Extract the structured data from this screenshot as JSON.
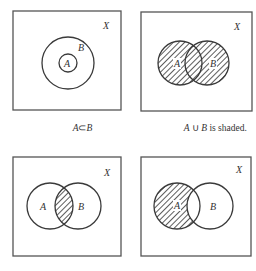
{
  "figure": {
    "colors": {
      "stroke": "#3a3a3a",
      "frame": "#555555",
      "hatch": "#333333",
      "background": "#ffffff"
    },
    "panels": [
      {
        "id": "subset",
        "universe_label": "X",
        "set_labels": {
          "A": "A",
          "B": "B"
        },
        "relationship": "A inside B",
        "shaded_region": "none",
        "caption_parts": [
          {
            "text": "A",
            "italic": true
          },
          {
            "text": "⊂",
            "italic": false
          },
          {
            "text": "B",
            "italic": true
          }
        ]
      },
      {
        "id": "union",
        "universe_label": "X",
        "set_labels": {
          "A": "A",
          "B": "B"
        },
        "relationship": "overlapping",
        "shaded_region": "A ∪ B",
        "caption_parts": [
          {
            "text": "A",
            "italic": true
          },
          {
            "text": " ∪ ",
            "italic": false
          },
          {
            "text": "B",
            "italic": true
          },
          {
            "text": " is shaded.",
            "italic": false
          }
        ]
      },
      {
        "id": "intersection",
        "universe_label": "X",
        "set_labels": {
          "A": "A",
          "B": "B"
        },
        "relationship": "overlapping",
        "shaded_region": "A ∩ B",
        "caption_parts": []
      },
      {
        "id": "difference",
        "universe_label": "X",
        "set_labels": {
          "A": "A",
          "B": "B"
        },
        "relationship": "overlapping",
        "shaded_region": "A − B",
        "caption_parts": []
      }
    ]
  }
}
